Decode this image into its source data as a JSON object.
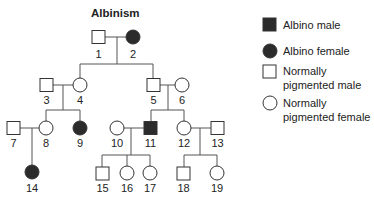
{
  "title": "Albinism",
  "colors": {
    "affected": "#2b2b2b",
    "unaffected": "#ffffff",
    "stroke": "#333333",
    "line": "#555555"
  },
  "individuals": [
    {
      "id": "1",
      "sex": "male",
      "affected": false,
      "label": "1"
    },
    {
      "id": "2",
      "sex": "female",
      "affected": true,
      "label": "2"
    },
    {
      "id": "3",
      "sex": "male",
      "affected": false,
      "label": "3"
    },
    {
      "id": "4",
      "sex": "female",
      "affected": false,
      "label": "4"
    },
    {
      "id": "5",
      "sex": "male",
      "affected": false,
      "label": "5"
    },
    {
      "id": "6",
      "sex": "female",
      "affected": false,
      "label": "6"
    },
    {
      "id": "7",
      "sex": "male",
      "affected": false,
      "label": "7"
    },
    {
      "id": "8",
      "sex": "female",
      "affected": false,
      "label": "8"
    },
    {
      "id": "9",
      "sex": "female",
      "affected": true,
      "label": "9"
    },
    {
      "id": "10",
      "sex": "female",
      "affected": false,
      "label": "10"
    },
    {
      "id": "11",
      "sex": "male",
      "affected": true,
      "label": "11"
    },
    {
      "id": "12",
      "sex": "female",
      "affected": false,
      "label": "12"
    },
    {
      "id": "13",
      "sex": "male",
      "affected": false,
      "label": "13"
    },
    {
      "id": "14",
      "sex": "female",
      "affected": true,
      "label": "14"
    },
    {
      "id": "15",
      "sex": "male",
      "affected": false,
      "label": "15"
    },
    {
      "id": "16",
      "sex": "female",
      "affected": false,
      "label": "16"
    },
    {
      "id": "17",
      "sex": "female",
      "affected": false,
      "label": "17"
    },
    {
      "id": "18",
      "sex": "male",
      "affected": false,
      "label": "18"
    },
    {
      "id": "19",
      "sex": "female",
      "affected": false,
      "label": "19"
    }
  ],
  "couples": [
    {
      "partners": [
        "1",
        "2"
      ],
      "children": [
        "4",
        "5"
      ]
    },
    {
      "partners": [
        "3",
        "4"
      ],
      "children": [
        "8",
        "9"
      ]
    },
    {
      "partners": [
        "5",
        "6"
      ],
      "children": [
        "11",
        "12"
      ]
    },
    {
      "partners": [
        "7",
        "8"
      ],
      "children": [
        "14"
      ]
    },
    {
      "partners": [
        "10",
        "11"
      ],
      "children": [
        "15",
        "16",
        "17"
      ]
    },
    {
      "partners": [
        "12",
        "13"
      ],
      "children": [
        "18",
        "19"
      ]
    }
  ],
  "legend": {
    "items": [
      {
        "symbol": "filled-square",
        "line1": "Albino male",
        "line2": ""
      },
      {
        "symbol": "filled-circle",
        "line1": "Albino female",
        "line2": ""
      },
      {
        "symbol": "open-square",
        "line1": "Normally",
        "line2": "pigmented male"
      },
      {
        "symbol": "open-circle",
        "line1": "Normally",
        "line2": "pigmented female"
      }
    ]
  }
}
